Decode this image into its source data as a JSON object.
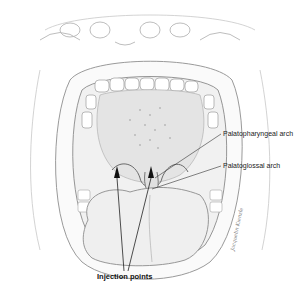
{
  "figure": {
    "labels": {
      "palatopharyngeal": "Palatopharyngeal arch",
      "palatoglossal": "Palatoglossal arch",
      "injection": "Injection points"
    },
    "signature": "Jacquelin Kienzle",
    "colors": {
      "line": "#555555",
      "shade": "#bbbbbb",
      "text": "#222222",
      "background": "#ffffff"
    }
  }
}
